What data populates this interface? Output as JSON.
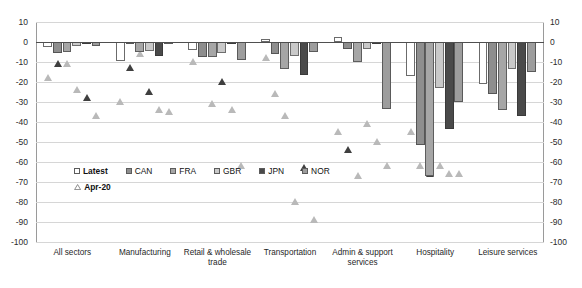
{
  "chart_data": {
    "type": "bar",
    "title": "",
    "xlabel": "",
    "ylabel": "",
    "ylim": [
      -100,
      10
    ],
    "ytick_step": 10,
    "grid": true,
    "legend_position": "inside-bottom-left",
    "yticks": [
      "10",
      "0",
      "-10",
      "-20",
      "-30",
      "-40",
      "-50",
      "-60",
      "-70",
      "-80",
      "-90",
      "-100"
    ],
    "categories": [
      "All sectors",
      "Manufacturing",
      "Retail & wholesale trade",
      "Transportation",
      "Admin & support services",
      "Hospitality",
      "Leisure services"
    ],
    "series": [
      {
        "name": "Latest",
        "color": "#ffffff",
        "values": [
          -2.6,
          -9.3,
          -4.1,
          1.6,
          2.3,
          -17.2,
          -21.0
        ]
      },
      {
        "name": "CAN",
        "color": "#8e8e8e",
        "values": [
          -5.3,
          -0.9,
          -7.7,
          -6.1,
          -3.6,
          -51.7,
          -26.2
        ]
      },
      {
        "name": "FRA",
        "color": "#a6a6a6",
        "values": [
          -4.8,
          -5.1,
          -7.3,
          -13.3,
          -9.8,
          -67.0,
          -34.0
        ]
      },
      {
        "name": "GBR",
        "color": "#c9c9c9",
        "values": [
          -2.0,
          -4.5,
          -5.6,
          -7.2,
          -3.5,
          -22.8,
          -13.4
        ]
      },
      {
        "name": "JPN",
        "color": "#4a4a4a",
        "values": [
          -1.0,
          -7.1,
          -0.6,
          -16.3,
          -0.5,
          -43.3,
          -37.0
        ]
      },
      {
        "name": "NOR",
        "color": "#9d9d9d",
        "values": [
          -2.1,
          -1.1,
          -8.9,
          -5.0,
          -33.3,
          -30.1,
          -14.9
        ]
      }
    ],
    "marker_series": {
      "name": "Apr-20",
      "marker": "triangle",
      "color": "#b9b9b9",
      "dark_color": "#3f3f3f",
      "values": [
        [
          -18.0,
          -11.0,
          -11.0,
          -24.0,
          -28.0,
          -37.0
        ],
        [
          -30.0,
          -13.0,
          -6.0,
          -25.0,
          -34.0,
          -35.0
        ],
        [
          -10.0,
          -5.0,
          -31.0,
          -20.0,
          -34.0,
          -62.0
        ],
        [
          -8.0,
          -26.0,
          -37.0,
          -80.0,
          -63.0,
          -89.0
        ],
        [
          -45.0,
          -54.0,
          -67.0,
          -41.0,
          -50.0,
          -62.0
        ],
        [
          -45.0,
          -62.0,
          -66.0,
          -62.0,
          -66.0,
          -66.0
        ]
      ]
    }
  },
  "legend": {
    "items": [
      {
        "label": "Latest",
        "swatch": "latest-swatch"
      },
      {
        "label": "CAN",
        "swatch": "can-swatch"
      },
      {
        "label": "FRA",
        "swatch": "fra-swatch"
      },
      {
        "label": "GBR",
        "swatch": "gbr-swatch"
      },
      {
        "label": "JPN",
        "swatch": "jpn-swatch"
      },
      {
        "label": "NOR",
        "swatch": "nor-swatch"
      }
    ],
    "marker_label": "Apr-20"
  }
}
